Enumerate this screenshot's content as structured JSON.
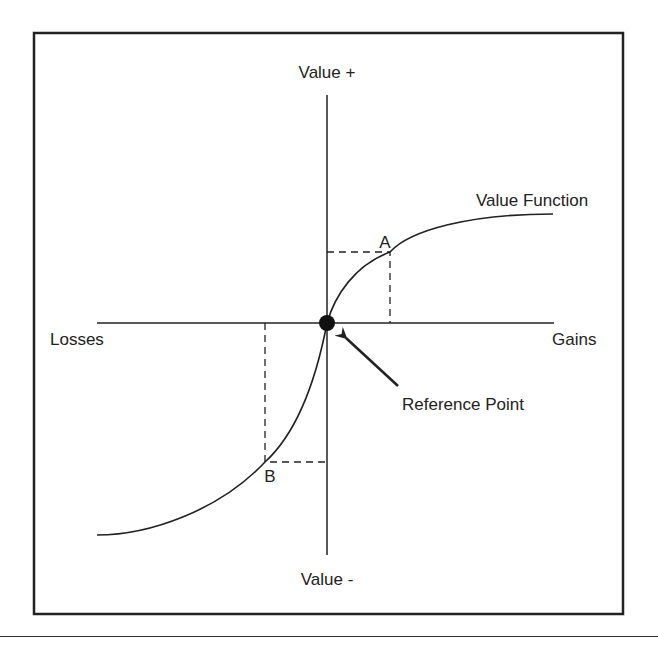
{
  "title_fragment": "",
  "diagram": {
    "type": "prospect-theory-value-function",
    "labels": {
      "y_positive": "Value +",
      "y_negative": "Value -",
      "x_negative": "Losses",
      "x_positive": "Gains",
      "curve": "Value Function",
      "reference_point": "Reference Point",
      "point_a": "A",
      "point_b": "B"
    },
    "colors": {
      "stroke": "#222222",
      "background": "#ffffff"
    },
    "geometry": {
      "frame": {
        "x": 34,
        "y": 33,
        "w": 589,
        "h": 581
      },
      "origin": {
        "x": 327,
        "y": 323
      },
      "x_axis": {
        "x1": 97,
        "x2": 554,
        "y": 323
      },
      "y_axis": {
        "y1": 95,
        "y2": 555,
        "x": 327
      },
      "point_a": {
        "x": 390,
        "y": 252
      },
      "point_b": {
        "x": 265,
        "y": 462
      },
      "curve_ends": {
        "left": {
          "x": 97,
          "y": 535
        },
        "right": {
          "x": 553,
          "y": 214
        }
      }
    }
  }
}
